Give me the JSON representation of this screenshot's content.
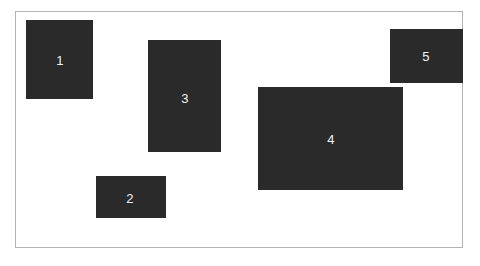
{
  "canvas": {
    "width": 480,
    "height": 266,
    "background_color": "#ffffff"
  },
  "frame": {
    "name": "diagram-frame",
    "x": 15,
    "y": 11,
    "width": 448,
    "height": 237,
    "border_color": "#b2b2b2",
    "border_width": 1,
    "fill": "none"
  },
  "style": {
    "region_fill_color": "#2a2a2a",
    "label_color": "#f2f2f2",
    "label_font_size": 13
  },
  "regions": [
    {
      "id": "region-1",
      "label": "1",
      "x": 26,
      "y": 20,
      "width": 67,
      "height": 79,
      "label_x": 60,
      "label_y": 60
    },
    {
      "id": "region-2",
      "label": "2",
      "x": 96,
      "y": 176,
      "width": 70,
      "height": 42,
      "label_x": 130,
      "label_y": 198
    },
    {
      "id": "region-3",
      "label": "3",
      "x": 148,
      "y": 40,
      "width": 73,
      "height": 112,
      "label_x": 185,
      "label_y": 98
    },
    {
      "id": "region-4",
      "label": "4",
      "x": 258,
      "y": 87,
      "width": 145,
      "height": 103,
      "label_x": 331,
      "label_y": 139
    },
    {
      "id": "region-5",
      "label": "5",
      "x": 390,
      "y": 29,
      "width": 73,
      "height": 54,
      "label_x": 426,
      "label_y": 56
    }
  ]
}
